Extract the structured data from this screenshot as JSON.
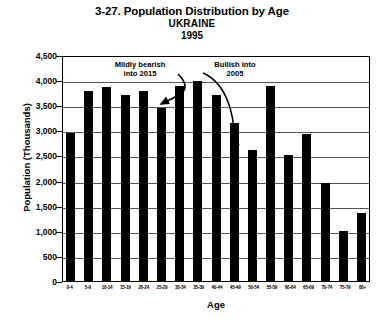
{
  "chart_data": {
    "type": "bar",
    "title": "3-27. Population Distribution by Age",
    "subtitle": "UKRAINE",
    "year": "1995",
    "xlabel": "Age",
    "ylabel": "Population (Thousands)",
    "ylim": [
      0,
      4500
    ],
    "ytick_labels": [
      "4,500",
      "4,000",
      "3,500",
      "3,000",
      "2,500",
      "2,000",
      "1,500",
      "1,000",
      "500",
      "0"
    ],
    "ytick_values": [
      4500,
      4000,
      3500,
      3000,
      2500,
      2000,
      1500,
      1000,
      500,
      0
    ],
    "grid": true,
    "legend": "none",
    "bar_color": "#000000",
    "categories": [
      "0-4",
      "5-9",
      "10-14",
      "15-19",
      "20-24",
      "25-29",
      "30-34",
      "35-39",
      "40-44",
      "45-49",
      "50-54",
      "55-59",
      "60-64",
      "65-69",
      "70-74",
      "75-79",
      "80+"
    ],
    "values": [
      2950,
      3780,
      3860,
      3700,
      3780,
      3440,
      3880,
      3990,
      3700,
      3150,
      2600,
      3880,
      2500,
      2920,
      1960,
      990,
      1350
    ],
    "annotations": [
      {
        "text": "Mildly bearish\ninto 2015",
        "points_to": "25-29"
      },
      {
        "text": "Bullish into\n2005",
        "points_to": "50-54"
      }
    ]
  },
  "titles": {
    "main": "3-27. Population Distribution by Age",
    "sub": "UKRAINE",
    "year": "1995"
  },
  "axes": {
    "y_label": "Population (Thousands)",
    "x_label": "Age"
  },
  "annotations": {
    "left": "Mildly bearish\ninto 2015",
    "right": "Bullish into\n2005"
  }
}
